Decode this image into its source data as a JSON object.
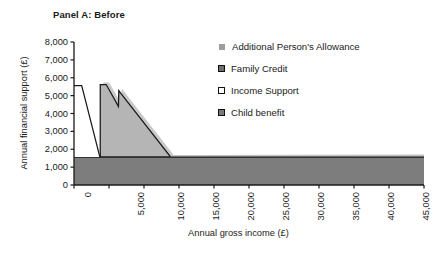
{
  "panel": {
    "title": "Panel A: Before"
  },
  "chart_data": {
    "type": "area",
    "title": "Panel A: Before",
    "xlabel": "Annual gross income (£)",
    "ylabel": "Annual financial support (£)",
    "xlim": [
      0,
      50000
    ],
    "ylim": [
      0,
      8000
    ],
    "xticks": [
      0,
      5000,
      10000,
      15000,
      20000,
      25000,
      30000,
      35000,
      40000,
      45000,
      50000
    ],
    "xtick_labels": [
      "0",
      "5,000",
      "10,000",
      "15,000",
      "20,000",
      "25,000",
      "30,000",
      "35,000",
      "40,000",
      "45,000",
      "50,000"
    ],
    "yticks": [
      0,
      1000,
      2000,
      3000,
      4000,
      5000,
      6000,
      7000,
      8000
    ],
    "ytick_labels": [
      "0",
      "1,000",
      "2,000",
      "3,000",
      "4,000",
      "5,000",
      "6,000",
      "7,000",
      "8,000"
    ],
    "grid": false,
    "legend_position": "right",
    "stacked": true,
    "series": [
      {
        "name": "Child benefit",
        "color": "#808080",
        "swatch": "dark-gray",
        "points": [
          {
            "x": 0,
            "y": 1560
          },
          {
            "x": 50000,
            "y": 1560
          }
        ]
      },
      {
        "name": "Income Support",
        "color": "#ffffff",
        "swatch": "white",
        "points": [
          {
            "x": 0,
            "y": 5560
          },
          {
            "x": 1100,
            "y": 5560
          },
          {
            "x": 3700,
            "y": 1560
          },
          {
            "x": 3750,
            "y": 1560
          }
        ]
      },
      {
        "name": "Family Credit",
        "color": "#b3b3b3",
        "swatch": "mid-gray",
        "points": [
          {
            "x": 3750,
            "y": 1560
          },
          {
            "x": 3750,
            "y": 5620
          },
          {
            "x": 4600,
            "y": 5620
          },
          {
            "x": 6350,
            "y": 4400
          },
          {
            "x": 6400,
            "y": 5280
          },
          {
            "x": 6750,
            "y": 5100
          },
          {
            "x": 13700,
            "y": 1620
          },
          {
            "x": 13700,
            "y": 1560
          }
        ]
      },
      {
        "name": "Additional Person's Allowance",
        "color": "#bfbfbf",
        "swatch": "light-gray",
        "points": [
          {
            "x": 0,
            "y": 1660
          },
          {
            "x": 50000,
            "y": 1700
          }
        ]
      }
    ],
    "annotations": []
  },
  "legend": {
    "items": [
      {
        "label": "Additional Person's Allowance",
        "swatch_fill": "#9d9d9d",
        "swatch_border": "#9d9d9d",
        "icon": "legend-swatch-additional-persons-allowance"
      },
      {
        "label": "Family Credit",
        "swatch_fill": "#6e6e6e",
        "swatch_border": "#111111",
        "icon": "legend-swatch-family-credit"
      },
      {
        "label": "Income Support",
        "swatch_fill": "#ffffff",
        "swatch_border": "#111111",
        "icon": "legend-swatch-income-support"
      },
      {
        "label": "Child benefit",
        "swatch_fill": "#7a7a7a",
        "swatch_border": "#111111",
        "icon": "legend-swatch-child-benefit"
      }
    ]
  },
  "axes": {
    "y_title": "Annual financial support (£)",
    "x_title": "Annual gross income (£)"
  }
}
